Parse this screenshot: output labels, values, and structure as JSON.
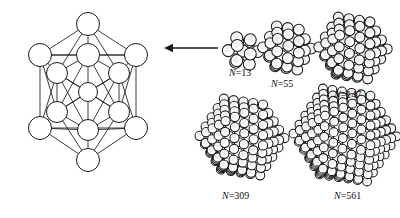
{
  "figure": {
    "background_color": "#ffffff",
    "stroke_color": "#1a1a1a",
    "fill_color": "#ffffff",
    "shading_color": "#efefef",
    "width": 400,
    "height": 218
  },
  "schematic": {
    "name": "icosahedron-wireframe",
    "description": "13-atom icosahedral cluster shown as a ball-and-stick wireframe",
    "atom_count": 13,
    "center_x": 88,
    "center_y": 92,
    "outer_radius": 11.5,
    "inner_radius": 10.5,
    "center_radius": 9.5,
    "vertices": [
      {
        "id": "top",
        "x": 88,
        "y": 24,
        "r": 11.5,
        "ring": "outer"
      },
      {
        "id": "upper-left",
        "x": 40,
        "y": 55,
        "r": 11.5,
        "ring": "outer"
      },
      {
        "id": "upper-right",
        "x": 136,
        "y": 55,
        "r": 11.5,
        "ring": "outer"
      },
      {
        "id": "lower-left",
        "x": 40,
        "y": 128,
        "r": 11.5,
        "ring": "outer"
      },
      {
        "id": "lower-right",
        "x": 136,
        "y": 128,
        "r": 11.5,
        "ring": "outer"
      },
      {
        "id": "bottom",
        "x": 88,
        "y": 160,
        "r": 11.5,
        "ring": "outer"
      },
      {
        "id": "mid-top",
        "x": 88,
        "y": 55,
        "r": 11.5,
        "ring": "inner"
      },
      {
        "id": "mid-upper-l",
        "x": 57,
        "y": 73,
        "r": 10.5,
        "ring": "inner"
      },
      {
        "id": "mid-upper-r",
        "x": 119,
        "y": 73,
        "r": 10.5,
        "ring": "inner"
      },
      {
        "id": "mid-lower-l",
        "x": 57,
        "y": 112,
        "r": 10.5,
        "ring": "inner"
      },
      {
        "id": "mid-lower-r",
        "x": 119,
        "y": 112,
        "r": 10.5,
        "ring": "inner"
      },
      {
        "id": "mid-bottom",
        "x": 88,
        "y": 130,
        "r": 10.5,
        "ring": "inner"
      },
      {
        "id": "center",
        "x": 88,
        "y": 92,
        "r": 9.5,
        "ring": "center"
      }
    ]
  },
  "arrow": {
    "name": "arrow-left",
    "direction": "left",
    "x_start": 218,
    "x_end": 164,
    "y": 48,
    "head_size": 5
  },
  "clusters": [
    {
      "id": "n13",
      "label_symbol": "N",
      "label_equals": "=",
      "label_value": "13",
      "label_text": "N=13",
      "atom_count": 13,
      "shells": 1,
      "cx": 243,
      "cy": 51,
      "radius": 18,
      "sphere_radius": 6.0,
      "label_x": 229,
      "label_y": 67
    },
    {
      "id": "n55",
      "label_symbol": "N",
      "label_equals": "=",
      "label_value": "55",
      "label_text": "N=55",
      "atom_count": 55,
      "shells": 2,
      "cx": 287,
      "cy": 48,
      "radius": 27,
      "sphere_radius": 5.4,
      "label_x": 271,
      "label_y": 78
    },
    {
      "id": "n147",
      "label_symbol": "N",
      "label_equals": "=",
      "label_value": "147",
      "label_text": "N=147",
      "atom_count": 147,
      "shells": 3,
      "cx": 353,
      "cy": 48,
      "radius": 37,
      "sphere_radius": 5.0,
      "label_x": 334,
      "label_y": 89
    },
    {
      "id": "n309",
      "label_symbol": "N",
      "label_equals": "=",
      "label_value": "309",
      "label_text": "N=309",
      "atom_count": 309,
      "shells": 4,
      "cx": 242,
      "cy": 137,
      "radius": 45,
      "sphere_radius": 4.6,
      "label_x": 222,
      "label_y": 190
    },
    {
      "id": "n561",
      "label_symbol": "N",
      "label_equals": "=",
      "label_value": "561",
      "label_text": "N=561",
      "atom_count": 561,
      "shells": 5,
      "cx": 345,
      "cy": 135,
      "radius": 54,
      "sphere_radius": 4.4,
      "label_x": 334,
      "label_y": 190
    }
  ]
}
